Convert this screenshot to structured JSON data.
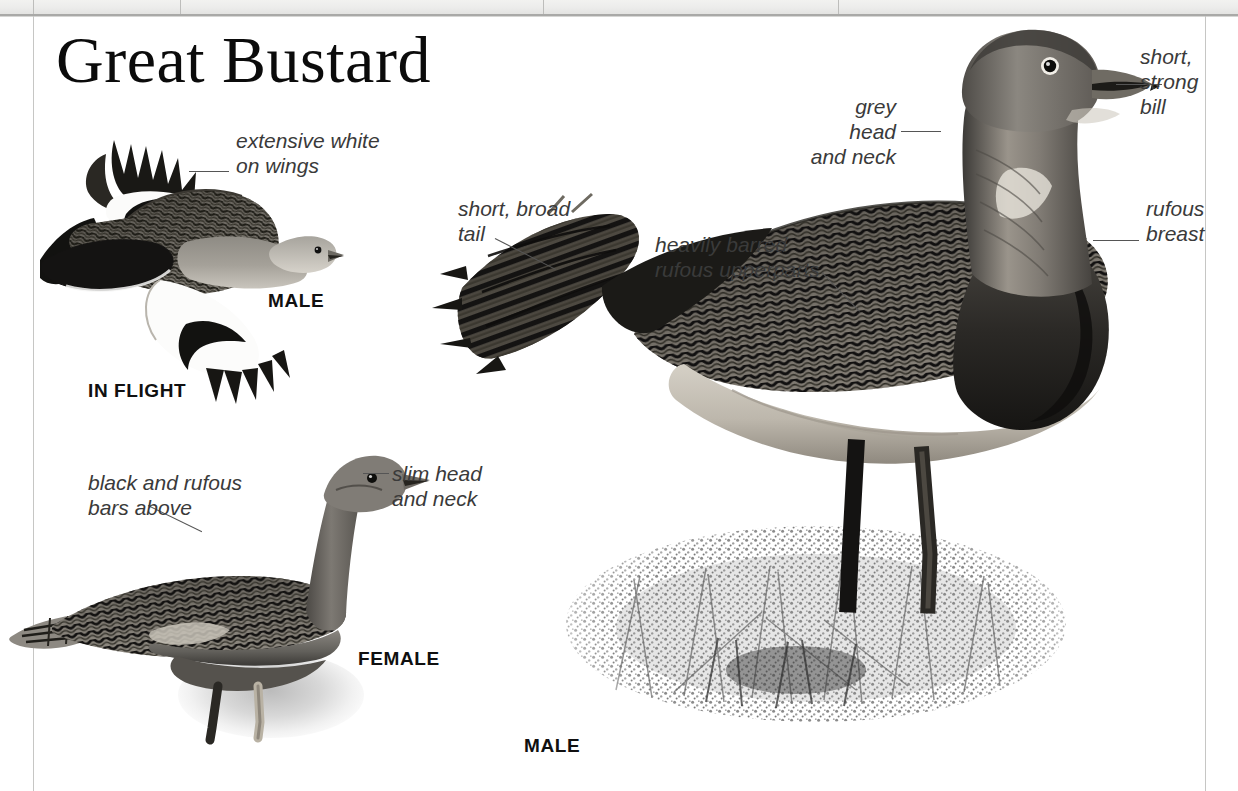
{
  "page": {
    "title": "Great Bustard",
    "background": "#ffffff",
    "rule_color": "#a9a9a7",
    "margin_color": "#c6c6c4"
  },
  "captions": [
    {
      "id": "in-flight",
      "text": "IN FLIGHT"
    },
    {
      "id": "male-flight",
      "text": "MALE"
    },
    {
      "id": "female",
      "text": "FEMALE"
    },
    {
      "id": "male-standing",
      "text": "MALE"
    }
  ],
  "annotations": [
    {
      "id": "extensive-white-on-wings",
      "text": "extensive white\non wings"
    },
    {
      "id": "short-strong-bill",
      "text": "short,\nstrong\nbill"
    },
    {
      "id": "grey-head-and-neck",
      "text": "grey head\nand neck"
    },
    {
      "id": "rufous-breast",
      "text": "rufous\nbreast"
    },
    {
      "id": "short-broad-tail",
      "text": "short, broad\ntail"
    },
    {
      "id": "heavily-barred-rufous-upperparts",
      "text": "heavily barred\nrufous upperparts"
    },
    {
      "id": "black-and-rufous-bars-above",
      "text": "black and rufous\nbars above"
    },
    {
      "id": "slim-head-and-neck",
      "text": "slim head\nand neck"
    }
  ],
  "figures": [
    {
      "id": "male-in-flight",
      "subject": "Great Bustard male in flight, barred rufous upperwing with extensive white wing panel and black primaries"
    },
    {
      "id": "female-standing",
      "subject": "Great Bustard female standing, slim grey head and neck, black and rufous barred upperparts"
    },
    {
      "id": "male-standing",
      "subject": "Great Bustard male standing in grass, grey head and neck, rufous breast band, heavily barred rufous upperparts, short broad tail"
    }
  ],
  "colors": {
    "ink": "#0b0b0b",
    "label_text": "#3a3a3a",
    "leader": "#555555",
    "plumage_dark": "#1d1d1d",
    "plumage_mid": "#6e6a63",
    "plumage_light": "#cfcac1",
    "grass": "#8d8d8d"
  }
}
